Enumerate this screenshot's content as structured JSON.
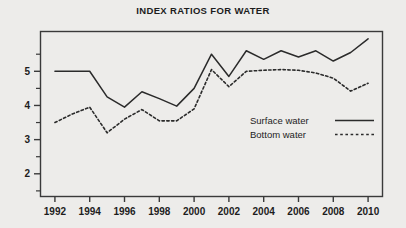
{
  "chart_data": {
    "type": "line",
    "title": "INDEX RATIOS FOR WATER",
    "xlabel": "",
    "ylabel": "",
    "x": [
      1992,
      1993,
      1994,
      1995,
      1996,
      1997,
      1998,
      1999,
      2000,
      2001,
      2002,
      2003,
      2004,
      2005,
      2006,
      2007,
      2008,
      2009,
      2010
    ],
    "categories": [
      "1992",
      "1993",
      "1994",
      "1995",
      "1996",
      "1997",
      "1998",
      "1999",
      "2000",
      "2001",
      "2002",
      "2003",
      "2004",
      "2005",
      "2006",
      "2007",
      "2008",
      "2009",
      "2010"
    ],
    "xtick_labels": [
      "1992",
      "1994",
      "1996",
      "1998",
      "2000",
      "2002",
      "2004",
      "2006",
      "2008",
      "2010"
    ],
    "xtick_values": [
      1992,
      1994,
      1996,
      1998,
      2000,
      2002,
      2004,
      2006,
      2008,
      2010
    ],
    "ytick_labels": [
      "2",
      "3",
      "4",
      "5"
    ],
    "ytick_values": [
      2,
      3,
      4,
      5
    ],
    "yminor_values": [
      1.5,
      2.5,
      3.5,
      4.5,
      5.5
    ],
    "xlim": [
      1991.2,
      2010.8
    ],
    "ylim": [
      1.35,
      6.15
    ],
    "grid": false,
    "legend_position": "inside-right",
    "series": [
      {
        "name": "Surface water",
        "style": "solid",
        "color": "#2b2b2b",
        "values": [
          5.0,
          5.0,
          5.0,
          4.25,
          3.95,
          4.4,
          4.2,
          3.98,
          4.5,
          5.5,
          4.85,
          5.6,
          5.35,
          5.6,
          5.42,
          5.6,
          5.3,
          5.55,
          5.95
        ]
      },
      {
        "name": "Bottom water",
        "style": "dotted",
        "color": "#2b2b2b",
        "values": [
          3.5,
          3.75,
          3.95,
          3.2,
          3.6,
          3.88,
          3.55,
          3.55,
          3.9,
          5.05,
          4.55,
          5.0,
          5.03,
          5.05,
          5.03,
          4.95,
          4.8,
          4.42,
          4.65
        ]
      }
    ]
  },
  "legend": {
    "items": [
      {
        "label": "Surface water",
        "style": "solid"
      },
      {
        "label": "Bottom water",
        "style": "dotted"
      }
    ]
  },
  "colors": {
    "background": "#edecea",
    "frame": "#3a3a3a",
    "ink": "#1d1d1d",
    "line": "#2b2b2b"
  }
}
